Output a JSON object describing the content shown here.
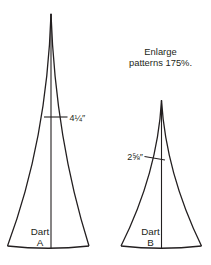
{
  "diagram_title": "Dart enlargement pattern diagram",
  "instruction": {
    "line1": "Enlarge",
    "line2": "patterns 175%."
  },
  "darts": [
    {
      "name_line1": "Dart",
      "name_line2": "A",
      "measurement": "4¼″"
    },
    {
      "name_line1": "Dart",
      "name_line2": "B",
      "measurement": "2⅝″"
    }
  ],
  "colors": {
    "ink": "#231f20",
    "background": "#ffffff"
  }
}
